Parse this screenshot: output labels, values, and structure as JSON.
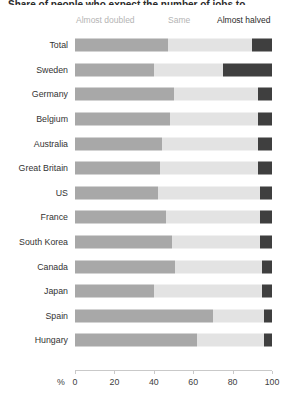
{
  "title_sliver": "Share of people who expect the number of jobs to change",
  "legend": {
    "doubled": "Almost doubled",
    "same": "Same",
    "halved": "Almost halved"
  },
  "axis": {
    "unit": "%",
    "ticks": [
      0,
      20,
      40,
      60,
      80,
      100
    ],
    "tick_labels": [
      "0",
      "20",
      "40",
      "60",
      "80",
      "100"
    ],
    "min": 0,
    "max": 100
  },
  "colors": {
    "almost_doubled": "#a8a8a8",
    "same": "#e3e3e3",
    "almost_halved": "#3f3f3f",
    "legend_muted": "#b4b4b4",
    "legend_dark": "#2b2b2b",
    "axis": "#c9c9c9"
  },
  "chart_data": {
    "type": "bar",
    "orientation": "horizontal",
    "stacked": true,
    "normalized": true,
    "title": "Share of people who expect the number of jobs to change",
    "xlabel": "%",
    "ylabel": "",
    "xlim": [
      0,
      100
    ],
    "grid": false,
    "legend_position": "top",
    "categories": [
      "Total",
      "Sweden",
      "Germany",
      "Belgium",
      "Australia",
      "Great Britain",
      "US",
      "France",
      "South Korea",
      "Canada",
      "Japan",
      "Spain",
      "Hungary"
    ],
    "series": [
      {
        "name": "Almost doubled",
        "color": "#a8a8a8",
        "values": [
          47,
          40,
          50,
          48,
          44,
          43,
          42,
          46,
          49,
          51,
          40,
          70,
          62
        ]
      },
      {
        "name": "Same",
        "color": "#e3e3e3",
        "values": [
          43,
          35,
          43,
          45,
          49,
          50,
          52,
          48,
          45,
          44,
          55,
          26,
          34
        ]
      },
      {
        "name": "Almost halved",
        "color": "#3f3f3f",
        "values": [
          10,
          25,
          7,
          7,
          7,
          7,
          6,
          6,
          6,
          5,
          5,
          4,
          4
        ]
      }
    ]
  }
}
